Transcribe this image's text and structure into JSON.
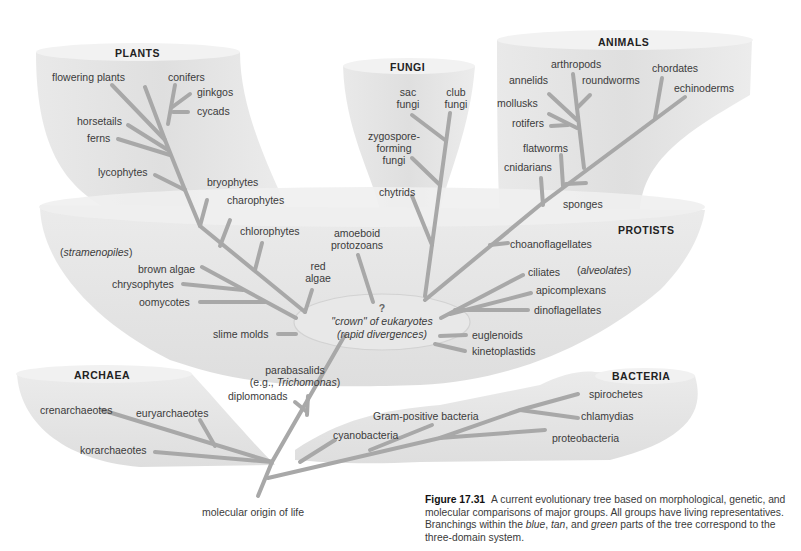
{
  "groups": {
    "plants": "PLANTS",
    "fungi": "FUNGI",
    "animals": "ANIMALS",
    "protists": "PROTISTS",
    "archaea": "ARCHAEA",
    "bacteria": "BACTERIA"
  },
  "plants": {
    "flowering_plants": "flowering plants",
    "conifers": "conifers",
    "ginkgos": "ginkgos",
    "cycads": "cycads",
    "horsetails": "horsetails",
    "ferns": "ferns",
    "lycophytes": "lycophytes",
    "bryophytes": "bryophytes",
    "charophytes": "charophytes",
    "chlorophytes": "chlorophytes"
  },
  "fungi": {
    "sac_1": "sac",
    "sac_2": "fungi",
    "club_1": "club",
    "club_2": "fungi",
    "zygo_1": "zygospore-",
    "zygo_2": "forming",
    "zygo_3": "fungi",
    "chytrids": "chytrids"
  },
  "animals": {
    "arthropods": "arthropods",
    "annelids": "annelids",
    "roundworms": "roundworms",
    "chordates": "chordates",
    "echinoderms": "echinoderms",
    "mollusks": "mollusks",
    "rotifers": "rotifers",
    "flatworms": "flatworms",
    "cnidarians": "cnidarians",
    "sponges": "sponges"
  },
  "protists": {
    "amoeboid_1": "amoeboid",
    "amoeboid_2": "protozoans",
    "stramenopiles": "stramenopiles",
    "brown_algae": "brown algae",
    "red_algae_1": "red",
    "red_algae_2": "algae",
    "chrysophytes": "chrysophytes",
    "oomycotes": "oomycotes",
    "slime_molds": "slime molds",
    "choanoflagellates": "choanoflagellates",
    "ciliates": "ciliates",
    "alveolates": "alveolates",
    "apicomplexans": "apicomplexans",
    "dinoflagellates": "dinoflagellates",
    "euglenoids": "euglenoids",
    "kinetoplastids": "kinetoplastids",
    "parabasalids": "parabasalids",
    "trichomonas_prefix": "(e.g., ",
    "trichomonas": "Trichomonas",
    "trichomonas_suffix": ")",
    "diplomonads": "diplomonads"
  },
  "crown": {
    "question": "?",
    "line1": "\"crown\" of eukaryotes",
    "line2": "(rapid divergences)"
  },
  "archaea": {
    "crenarchaeotes": "crenarchaeotes",
    "euryarchaeotes": "euryarchaeotes",
    "korarchaeotes": "korarchaeotes"
  },
  "bacteria": {
    "spirochetes": "spirochetes",
    "chlamydias": "chlamydias",
    "gram_positive": "Gram-positive bacteria",
    "cyanobacteria": "cyanobacteria",
    "proteobacteria": "proteobacteria"
  },
  "root": "molecular origin of life",
  "caption": {
    "figure": "Figure 17.31",
    "text_a": "A current evolutionary tree based on morphological, genetic, and molecular comparisons of major groups. All groups have living representatives. Branchings within the ",
    "blue": "blue",
    "comma1": ", ",
    "tan": "tan",
    "and": ", and ",
    "green": "green",
    "text_b": " parts of the tree correspond to the three-domain system."
  },
  "colors": {
    "branch": "#a9a9a9",
    "shape_fill": "#e6e6e6",
    "shape_rim": "#f1f1f1",
    "text": "#3b3b3b"
  }
}
